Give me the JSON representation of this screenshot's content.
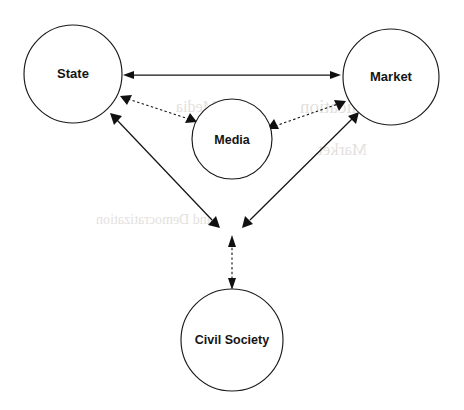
{
  "figure": {
    "type": "relationship-diagram",
    "background_color": "#ffffff",
    "line_color": "#141414",
    "label_color": "#151515",
    "width": 464,
    "height": 410
  },
  "nodes": [
    {
      "id": "state",
      "label": "State",
      "cx": 73,
      "cy": 74,
      "r": 49,
      "font_size": 13
    },
    {
      "id": "market",
      "label": "Market",
      "cx": 391,
      "cy": 77,
      "r": 48,
      "font_size": 13
    },
    {
      "id": "media",
      "label": "Media",
      "cx": 232,
      "cy": 139,
      "r": 40,
      "font_size": 12.5
    },
    {
      "id": "civil_society",
      "label": "Civil Society",
      "cx": 232,
      "cy": 340,
      "r": 51,
      "font_size": 12.5
    }
  ],
  "edges": [
    {
      "id": "state-market",
      "from": "state",
      "to": "market",
      "style": "solid",
      "arrows": "both"
    },
    {
      "id": "state-media",
      "from": "state",
      "to": "media",
      "style": "dashed",
      "arrows": "both"
    },
    {
      "id": "media-market",
      "from": "media",
      "to": "market",
      "style": "dashed",
      "arrows": "both"
    },
    {
      "id": "state-hub",
      "from": "state",
      "to": "hub",
      "style": "solid",
      "arrows": "both"
    },
    {
      "id": "market-hub",
      "from": "market",
      "to": "hub",
      "style": "solid",
      "arrows": "both"
    },
    {
      "id": "hub-civil-society",
      "from": "hub",
      "to": "civil_society",
      "style": "dashed",
      "arrows": "both"
    }
  ],
  "bleed_through": [
    {
      "text": "Communication",
      "x": 300,
      "y": 96,
      "size": 19
    },
    {
      "text": "Market",
      "x": 318,
      "y": 140,
      "size": 17
    },
    {
      "text": "and Democratization",
      "x": 96,
      "y": 212,
      "size": 14
    },
    {
      "text": "Media",
      "x": 176,
      "y": 98,
      "size": 16
    }
  ]
}
